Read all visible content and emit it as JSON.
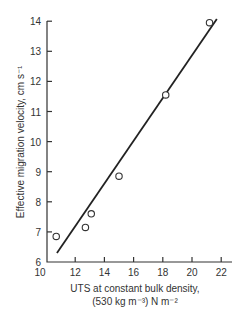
{
  "chart_data": {
    "type": "scatter",
    "title": "",
    "xlabel": "UTS at constant bulk density, (530 kg m⁻³) N m⁻²",
    "xlabel_line1": "UTS at constant bulk density,",
    "xlabel_line2": "(530 kg m⁻³) N m⁻²",
    "ylabel": "Effective migration velocity, cm s⁻¹",
    "xlim": [
      10,
      23
    ],
    "ylim": [
      6,
      14
    ],
    "x_ticks": [
      10,
      12,
      14,
      16,
      18,
      20,
      22
    ],
    "y_ticks": [
      6,
      7,
      8,
      9,
      10,
      11,
      12,
      13,
      14
    ],
    "grid": false,
    "legend": null,
    "series": [
      {
        "name": "Measured",
        "marker": "open-circle",
        "points": [
          {
            "x": 10.7,
            "y": 6.85
          },
          {
            "x": 12.7,
            "y": 7.15
          },
          {
            "x": 13.1,
            "y": 7.6
          },
          {
            "x": 15.0,
            "y": 8.85
          },
          {
            "x": 18.2,
            "y": 11.55
          },
          {
            "x": 21.2,
            "y": 13.95
          }
        ]
      },
      {
        "name": "Linear fit",
        "type": "line",
        "points": [
          {
            "x": 10.75,
            "y": 6.3
          },
          {
            "x": 21.7,
            "y": 14.07
          }
        ]
      }
    ]
  }
}
